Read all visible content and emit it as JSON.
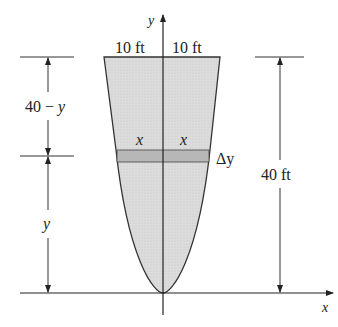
{
  "diagram": {
    "type": "parabolic tank cross-section with horizontal slice",
    "axes": {
      "x_label": "x",
      "y_label": "y"
    },
    "top_half_width_left": "10 ft",
    "top_half_width_right": "10 ft",
    "strip_half_left": "x",
    "strip_half_right": "x",
    "strip_thickness": "Δy",
    "left_upper_dimension": "40 − y",
    "left_lower_dimension": "y",
    "right_dimension": "40 ft",
    "colors": {
      "fill": "#d9d9d9",
      "strip": "#b5b5b5",
      "line": "#333333"
    }
  }
}
